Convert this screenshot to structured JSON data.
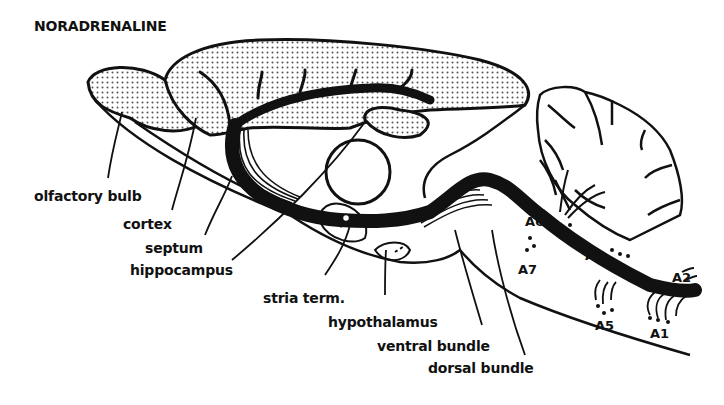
{
  "figure": {
    "title": "NORADRENALINE",
    "labels": {
      "olfactory_bulb": "olfactory bulb",
      "cortex": "cortex",
      "septum": "septum",
      "hippocampus": "hippocampus",
      "stria_term": "stria term.",
      "hypothalamus": "hypothalamus",
      "ventral_bundle": "ventral bundle",
      "dorsal_bundle": "dorsal bundle"
    },
    "cell_groups": {
      "A1": "A1",
      "A2": "A2",
      "A4": "A4",
      "A5": "A5",
      "A6": "A6",
      "A7": "A7"
    },
    "colors": {
      "ink": "#111111",
      "stipple": "#bdbdbd",
      "background": "#ffffff"
    }
  }
}
